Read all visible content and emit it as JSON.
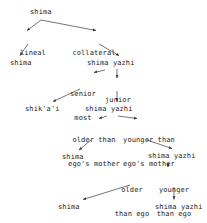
{
  "diagram": {
    "type": "kinship-terminology-tree",
    "style": {
      "text_color": "#1a1a1a",
      "line_color": "#3a3a3a",
      "background": "#ffffff"
    },
    "nodes": [
      {
        "id": "n1",
        "label": "shima",
        "x": 30,
        "y": 8
      },
      {
        "id": "n2",
        "label": "shima",
        "x": 10,
        "y": 59
      },
      {
        "id": "n3",
        "label": "shima yazhi",
        "x": 87,
        "y": 59
      },
      {
        "id": "n4",
        "label": "shik'a'i",
        "x": 25,
        "y": 105
      },
      {
        "id": "n5",
        "label": "shima yazhi",
        "x": 85,
        "y": 105
      },
      {
        "id": "n6",
        "label": "shima",
        "x": 62,
        "y": 153
      },
      {
        "id": "n7",
        "label": "shima yazhi",
        "x": 148,
        "y": 152
      },
      {
        "id": "n8",
        "label": "shima",
        "x": 58,
        "y": 203
      },
      {
        "id": "n9",
        "label": "shima yazhi",
        "x": 155,
        "y": 203
      }
    ],
    "edge_labels": [
      {
        "id": "e1",
        "lines": [
          "lineal"
        ],
        "x": 18,
        "y": 33,
        "w": 30
      },
      {
        "id": "e2",
        "lines": [
          "collateral"
        ],
        "x": 72,
        "y": 33,
        "w": 44
      },
      {
        "id": "e3",
        "lines": [
          "senior",
          "most"
        ],
        "x": 68,
        "y": 74,
        "w": 30
      },
      {
        "id": "e4",
        "lines": [
          "junior"
        ],
        "x": 104,
        "y": 80,
        "w": 28
      },
      {
        "id": "e5",
        "lines": [
          "older than",
          "ego's mother"
        ],
        "x": 68,
        "y": 120,
        "w": 52
      },
      {
        "id": "e6",
        "lines": [
          "younger than",
          "ego's mother"
        ],
        "x": 122,
        "y": 120,
        "w": 54
      },
      {
        "id": "e7",
        "lines": [
          "older",
          "than ego"
        ],
        "x": 114,
        "y": 170,
        "w": 36
      },
      {
        "id": "e8",
        "lines": [
          "younger",
          "than ego"
        ],
        "x": 156,
        "y": 170,
        "w": 36
      }
    ],
    "edges": [
      {
        "id": "a1",
        "from": "shima-top",
        "to": "lineal-branch",
        "x1": 41,
        "y1": 20,
        "x2": 26,
        "y2": 31
      },
      {
        "id": "a2",
        "from": "shima-top",
        "to": "collateral-branch",
        "x1": 41,
        "y1": 20,
        "x2": 98,
        "y2": 31
      },
      {
        "id": "a3",
        "from": "lineal",
        "to": "shima-lineal",
        "x1": 28,
        "y1": 44,
        "x2": 20,
        "y2": 56
      },
      {
        "id": "a4",
        "from": "collateral",
        "to": "shima-yazhi-1",
        "x1": 99,
        "y1": 44,
        "x2": 118,
        "y2": 56
      },
      {
        "id": "a5",
        "from": "shima-yazhi-1",
        "to": "senior-most-branch",
        "x1": 104,
        "y1": 70,
        "x2": 93,
        "y2": 72
      },
      {
        "id": "a6",
        "from": "shima-yazhi-1",
        "to": "junior-branch",
        "x1": 117,
        "y1": 70,
        "x2": 117,
        "y2": 78
      },
      {
        "id": "a7",
        "from": "senior-most",
        "to": "shikaai",
        "x1": 78,
        "y1": 88,
        "x2": 52,
        "y2": 102
      },
      {
        "id": "a8",
        "from": "junior",
        "to": "shima-yazhi-2",
        "x1": 117,
        "y1": 90,
        "x2": 117,
        "y2": 102
      },
      {
        "id": "a9",
        "from": "shima-yazhi-2",
        "to": "older-than-mother",
        "x1": 108,
        "y1": 116,
        "x2": 98,
        "y2": 118
      },
      {
        "id": "a10",
        "from": "shima-yazhi-2",
        "to": "younger-than-mother",
        "x1": 118,
        "y1": 116,
        "x2": 138,
        "y2": 118
      },
      {
        "id": "a11",
        "from": "older-than-mother",
        "to": "shima-mid",
        "x1": 90,
        "y1": 139,
        "x2": 78,
        "y2": 150
      },
      {
        "id": "a12",
        "from": "younger-than-mother",
        "to": "shima-yazhi-3",
        "x1": 146,
        "y1": 139,
        "x2": 172,
        "y2": 149
      },
      {
        "id": "a13",
        "from": "shima-yazhi-3",
        "to": "older-than-ego-branch",
        "x1": 168,
        "y1": 163,
        "x2": 168,
        "y2": 167
      },
      {
        "id": "a14",
        "from": "shima-yazhi-3",
        "to": "younger-than-ego-branch",
        "x1": 168,
        "y1": 163,
        "x2": 168,
        "y2": 167
      },
      {
        "id": "a15",
        "from": "older-than-ego",
        "to": "shima-bottom",
        "x1": 128,
        "y1": 184,
        "x2": 82,
        "y2": 200
      },
      {
        "id": "a16",
        "from": "younger-than-ego",
        "to": "shima-yazhi-bottom",
        "x1": 174,
        "y1": 186,
        "x2": 174,
        "y2": 200
      }
    ]
  }
}
